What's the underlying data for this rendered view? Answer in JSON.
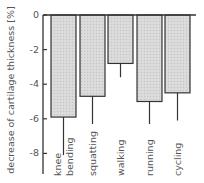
{
  "chart_data": {
    "type": "bar",
    "title": "",
    "xlabel": "",
    "ylabel": "decrease of cartilage thickness [%]",
    "categories": [
      "knee bending",
      "squatting",
      "walking",
      "running",
      "cycling"
    ],
    "category_label_lines": [
      [
        "knee",
        "bending"
      ],
      [
        "squatting"
      ],
      [
        "walking"
      ],
      [
        "running"
      ],
      [
        "cycling"
      ]
    ],
    "values": [
      -5.9,
      -4.7,
      -2.8,
      -5.0,
      -4.5
    ],
    "error_low": [
      -8.1,
      -6.3,
      -3.6,
      -6.3,
      -6.1
    ],
    "yticks": [
      0,
      -2,
      -4,
      -6,
      -8
    ],
    "ytick_labels": [
      "0",
      "-2",
      "-4",
      "-6",
      "-8"
    ],
    "ylim": [
      -9,
      0
    ],
    "grid": false,
    "legend": null,
    "colors": {
      "bar_fill": "#d9d9d9",
      "bar_edge": "#333333",
      "axis": "#333333"
    }
  }
}
